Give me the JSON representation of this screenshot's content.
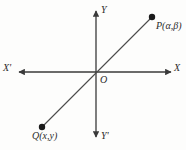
{
  "figure": {
    "type": "cartesian-coordinate-diagram",
    "background_color": "#fdfdfc",
    "stroke_color": "#3a3a3a",
    "text_color": "#2b2b2b"
  },
  "axes": {
    "x_positive_label": "X",
    "x_negative_label": "X'",
    "y_positive_label": "Y",
    "y_negative_label": "Y'",
    "origin_label": "O",
    "origin_px": {
      "x": 96,
      "y": 72
    },
    "x_axis_span_px": {
      "x1": 18,
      "x2": 172
    },
    "y_axis_span_px": {
      "y1": 10,
      "y2": 138
    },
    "arrowheads": [
      "x-positive",
      "x-negative",
      "y-positive",
      "y-negative"
    ]
  },
  "points": [
    {
      "id": "P",
      "label": "P(α,β)",
      "coords_text": "(α,β)",
      "quadrant": "I",
      "px": {
        "x": 152,
        "y": 17
      }
    },
    {
      "id": "Q",
      "label": "Q(x,y)",
      "coords_text": "(x,y)",
      "quadrant": "III",
      "px": {
        "x": 42,
        "y": 127
      }
    }
  ],
  "line": {
    "description": "straight line through Q, the origin O, and P",
    "from_px": {
      "x": 42,
      "y": 127
    },
    "to_px": {
      "x": 152,
      "y": 17
    },
    "passes_through_origin": true
  }
}
